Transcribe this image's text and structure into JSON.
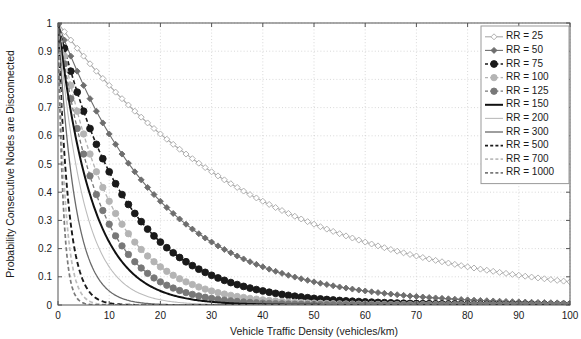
{
  "chart_data": {
    "type": "line",
    "title": "",
    "xlabel": "Vehicle Traffic Density (vehicles/km)",
    "ylabel": "Probability Consecutive Nodes are Disconnected",
    "xlim": [
      0,
      100
    ],
    "ylim": [
      0,
      1
    ],
    "xticks": [
      0,
      10,
      20,
      30,
      40,
      50,
      60,
      70,
      80,
      90,
      100
    ],
    "yticks": [
      0,
      0.1,
      0.2,
      0.3,
      0.4,
      0.5,
      0.6,
      0.7,
      0.8,
      0.9,
      1
    ],
    "xtick_labels": [
      "0",
      "10",
      "20",
      "30",
      "40",
      "50",
      "60",
      "70",
      "80",
      "90",
      "100"
    ],
    "ytick_labels": [
      "0",
      "0.1",
      "0.2",
      "0.3",
      "0.4",
      "0.5",
      "0.6",
      "0.7",
      "0.8",
      "0.9",
      "1"
    ],
    "grid": true,
    "grid_style": "dotted",
    "legend_position": "top-right",
    "model": "P(disconnected) = exp(-density * RR / 1000)",
    "series": [
      {
        "name": "RR = 25",
        "rr": 25,
        "color": "#a8a8a8",
        "line_style": "solid",
        "line_width": 1.1,
        "marker": "diamond",
        "marker_size": 3.0,
        "marker_filled": false,
        "values": [
          1,
          0.779,
          0.607,
          0.472,
          0.368,
          0.287,
          0.223,
          0.174,
          0.135,
          0.105,
          0.082
        ]
      },
      {
        "name": "RR = 50",
        "rr": 50,
        "color": "#6e6e6e",
        "line_style": "solid",
        "line_width": 1.1,
        "marker": "diamond",
        "marker_size": 3.0,
        "marker_filled": true,
        "values": [
          1,
          0.607,
          0.368,
          0.223,
          0.135,
          0.082,
          0.05,
          0.03,
          0.018,
          0.011,
          0.0067
        ]
      },
      {
        "name": "RR = 75",
        "rr": 75,
        "color": "#1a1a1a",
        "line_style": "dashed",
        "line_width": 1.6,
        "marker": "circle",
        "marker_size": 3.4,
        "marker_filled": true,
        "values": [
          1,
          0.472,
          0.223,
          0.105,
          0.05,
          0.024,
          0.011,
          0.0052,
          0.0025,
          0.0012,
          0.00055
        ]
      },
      {
        "name": "RR = 100",
        "rr": 100,
        "color": "#b4b4b4",
        "line_style": "dashed",
        "line_width": 1.3,
        "marker": "circle",
        "marker_size": 3.2,
        "marker_filled": true,
        "values": [
          1,
          0.368,
          0.135,
          0.05,
          0.018,
          0.0067,
          0.0025,
          0.00091,
          0.00034,
          0.00012,
          4.5e-05
        ]
      },
      {
        "name": "RR = 125",
        "rr": 125,
        "color": "#787878",
        "line_style": "dashed",
        "line_width": 1.3,
        "marker": "circle",
        "marker_size": 3.2,
        "marker_filled": true,
        "values": [
          1,
          0.287,
          0.082,
          0.024,
          0.0067,
          0.0019,
          0.00055,
          0.00016,
          4.5e-05,
          1.3e-05,
          3.7e-06
        ]
      },
      {
        "name": "RR = 150",
        "rr": 150,
        "color": "#111111",
        "line_style": "solid",
        "line_width": 2.0,
        "marker": "none",
        "marker_size": 0,
        "marker_filled": false,
        "values": [
          1,
          0.223,
          0.05,
          0.011,
          0.0025,
          0.00055,
          0.00012,
          2.7e-05,
          6.1e-06,
          1.4e-06,
          3e-07
        ]
      },
      {
        "name": "RR = 200",
        "rr": 200,
        "color": "#bcbcbc",
        "line_style": "solid",
        "line_width": 1.1,
        "marker": "none",
        "marker_size": 0,
        "marker_filled": false,
        "values": [
          1,
          0.135,
          0.018,
          0.0025,
          0.00034,
          4.5e-05,
          6.1e-06,
          8.3e-07,
          1.1e-07,
          1.5e-08,
          2e-09
        ]
      },
      {
        "name": "RR = 300",
        "rr": 300,
        "color": "#6a6a6a",
        "line_style": "solid",
        "line_width": 1.3,
        "marker": "none",
        "marker_size": 0,
        "marker_filled": false,
        "values": [
          1,
          0.05,
          0.0025,
          0.00012,
          6.1e-06,
          3e-07,
          1.5e-08,
          7.4e-10,
          0,
          0,
          0
        ]
      },
      {
        "name": "RR = 500",
        "rr": 500,
        "color": "#1a1a1a",
        "line_style": "dashed",
        "line_width": 1.9,
        "marker": "none",
        "marker_size": 0,
        "marker_filled": false,
        "values": [
          1,
          0.0067,
          4.5e-05,
          3e-07,
          2e-09,
          0,
          0,
          0,
          0,
          0,
          0
        ]
      },
      {
        "name": "RR = 700",
        "rr": 700,
        "color": "#bdbdbd",
        "line_style": "dashed",
        "line_width": 1.7,
        "marker": "none",
        "marker_size": 0,
        "marker_filled": false,
        "values": [
          1,
          0.00091,
          8.3e-07,
          0,
          0,
          0,
          0,
          0,
          0,
          0,
          0
        ]
      },
      {
        "name": "RR = 1000",
        "rr": 1000,
        "color": "#7a7a7a",
        "line_style": "dashed",
        "line_width": 1.7,
        "marker": "none",
        "marker_size": 0,
        "marker_filled": false,
        "values": [
          1,
          4.5e-05,
          2e-09,
          0,
          0,
          0,
          0,
          0,
          0,
          0,
          0
        ]
      }
    ],
    "x": [
      0,
      10,
      20,
      30,
      40,
      50,
      60,
      70,
      80,
      90,
      100
    ]
  },
  "legend": {
    "entries": [
      "RR = 25",
      "RR = 50",
      "RR = 75",
      "RR = 100",
      "RR = 125",
      "RR = 150",
      "RR = 200",
      "RR = 300",
      "RR = 500",
      "RR = 700",
      "RR = 1000"
    ]
  },
  "colors": {
    "axis": "#555555",
    "grid": "#c8c8c8",
    "background": "#ffffff",
    "text": "#1a1a1a",
    "legend_border": "#9a9a9a"
  }
}
